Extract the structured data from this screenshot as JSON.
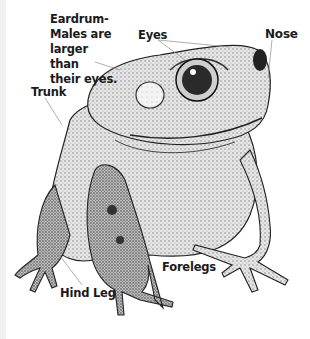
{
  "figure": {
    "labels": {
      "eardrum": "Eardrum-",
      "eardrum_note": [
        "Males are",
        "larger than",
        "their eyes."
      ],
      "eyes": "Eyes",
      "nose": "Nose",
      "trunk": "Trunk",
      "hind_leg": "Hind Leg",
      "forelegs": "Forelegs"
    },
    "colors": {
      "ink": "#1a1a1a",
      "skin_light": "#d9d9d9",
      "skin_mid": "#a8a8a8",
      "skin_dark": "#555555",
      "leader_line": "#9a9a9a",
      "background": "#ffffff"
    }
  }
}
